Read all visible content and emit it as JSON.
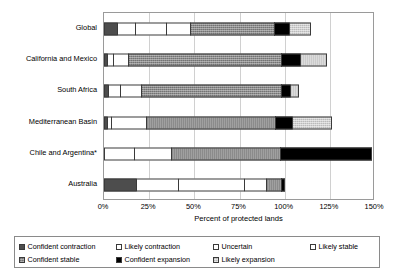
{
  "chart_data": {
    "type": "bar",
    "orientation": "horizontal",
    "stacked": true,
    "title": "",
    "xlabel": "Percent of protected lands",
    "ylabel": "",
    "xlim": [
      0,
      150
    ],
    "xticks": [
      "0%",
      "25%",
      "50%",
      "75%",
      "100%",
      "125%",
      "150%"
    ],
    "xtick_values": [
      0,
      25,
      50,
      75,
      100,
      125,
      150
    ],
    "grid": true,
    "legend_position": "bottom",
    "categories": [
      "Global",
      "California and Mexico",
      "South Africa",
      "Mediterranean Basin",
      "Chile and Argentina*",
      "Australia"
    ],
    "series": [
      {
        "name": "Confident contraction",
        "key": "confident-contraction",
        "color": "#4d4d4d",
        "values": [
          8,
          2,
          3,
          2,
          0,
          18
        ]
      },
      {
        "name": "Likely contraction",
        "key": "likely-contraction",
        "color": "#ffffff",
        "values": [
          10,
          4,
          7,
          3,
          17,
          24
        ]
      },
      {
        "name": "Uncertain",
        "key": "uncertain",
        "color": "#ffffff",
        "values": [
          18,
          9,
          12,
          20,
          21,
          37
        ]
      },
      {
        "name": "Likely stable",
        "key": "likely-stable",
        "color": "#ffffff",
        "values": [
          14,
          0,
          0,
          0,
          0,
          13
        ]
      },
      {
        "name": "Confident stable",
        "key": "confident-stable",
        "color": "#8c8c8c",
        "values": [
          47,
          85,
          78,
          72,
          61,
          9
        ]
      },
      {
        "name": "Confident expansion",
        "key": "confident-expansion",
        "color": "#000000",
        "values": [
          9,
          11,
          6,
          10,
          51,
          2
        ]
      },
      {
        "name": "Likely expansion",
        "key": "likely-expansion",
        "color": "#cfcfcf",
        "values": [
          12,
          15,
          5,
          22,
          0,
          0
        ]
      }
    ],
    "totals": [
      118,
      126,
      111,
      129,
      150,
      103
    ]
  },
  "legend": {
    "rows": [
      [
        {
          "label": "Confident contraction",
          "key": "confident-contraction"
        },
        {
          "label": "Likely contraction",
          "key": "likely-contraction"
        },
        {
          "label": "Uncertain",
          "key": "uncertain"
        },
        {
          "label": "Likely stable",
          "key": "likely-stable"
        }
      ],
      [
        {
          "label": "Confident stable",
          "key": "confident-stable"
        },
        {
          "label": "Confident expansion",
          "key": "confident-expansion"
        },
        {
          "label": "Likely expansion",
          "key": "likely-expansion"
        }
      ]
    ]
  }
}
